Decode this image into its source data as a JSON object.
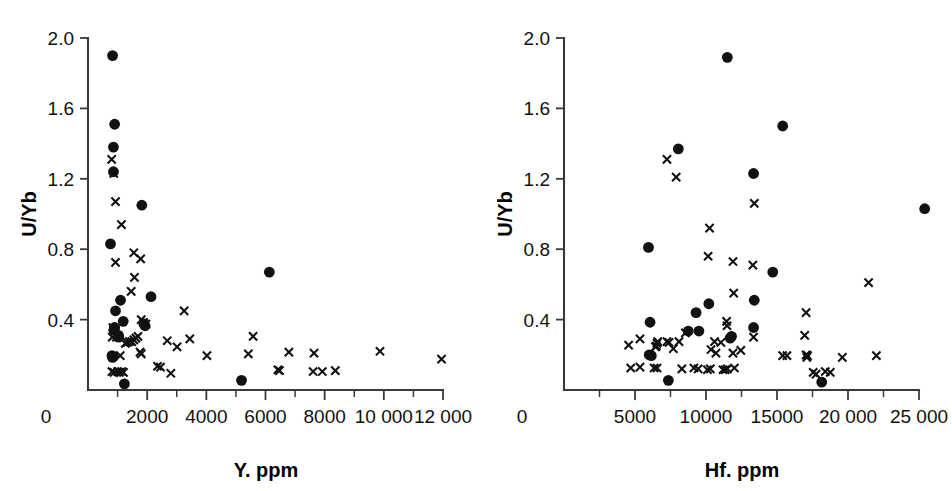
{
  "figure": {
    "background": "#ffffff",
    "marker_color": "#111111",
    "axis_color": "#3a3a3a",
    "panel_count": 2
  },
  "series_names": {
    "circle": "filled-circle-series",
    "cross": "cross-series"
  },
  "chart_data": [
    {
      "type": "scatter",
      "panel": "left",
      "title": "",
      "xlabel": "Y. ppm",
      "ylabel": "U/Yb",
      "xlim": [
        0,
        12000
      ],
      "ylim": [
        0,
        2.0
      ],
      "xticks": [
        0,
        2000,
        4000,
        6000,
        8000,
        10000,
        12000
      ],
      "xtick_labels": [
        "0",
        "2000",
        "4000",
        "6000",
        "8000",
        "10 000",
        "12 000"
      ],
      "yticks": [
        0.4,
        0.8,
        1.2,
        1.6,
        2.0
      ],
      "ytick_labels": [
        "0.4",
        "0.8",
        "1.2",
        "1.6",
        "2.0"
      ],
      "xminor_step": 1000,
      "grid": false,
      "legend": "none",
      "series": [
        {
          "name": "filled-circle-series",
          "marker": "circle",
          "points": [
            [
              830,
              1.9
            ],
            [
              900,
              1.51
            ],
            [
              860,
              1.38
            ],
            [
              860,
              1.24
            ],
            [
              1820,
              1.05
            ],
            [
              760,
              0.83
            ],
            [
              6130,
              0.67
            ],
            [
              1100,
              0.51
            ],
            [
              2130,
              0.53
            ],
            [
              930,
              0.45
            ],
            [
              1190,
              0.39
            ],
            [
              900,
              0.355
            ],
            [
              880,
              0.345
            ],
            [
              1030,
              0.31
            ],
            [
              1890,
              0.375
            ],
            [
              1930,
              0.365
            ],
            [
              1040,
              0.3
            ],
            [
              810,
              0.195
            ],
            [
              830,
              0.185
            ],
            [
              850,
              0.19
            ],
            [
              1230,
              0.035
            ],
            [
              5190,
              0.055
            ]
          ]
        },
        {
          "name": "cross-series",
          "marker": "cross",
          "points": [
            [
              800,
              1.31
            ],
            [
              870,
              1.23
            ],
            [
              930,
              1.07
            ],
            [
              1130,
              0.94
            ],
            [
              1550,
              0.78
            ],
            [
              1780,
              0.745
            ],
            [
              930,
              0.725
            ],
            [
              1570,
              0.64
            ],
            [
              1460,
              0.56
            ],
            [
              3250,
              0.45
            ],
            [
              1800,
              0.4
            ],
            [
              1880,
              0.385
            ],
            [
              1960,
              0.375
            ],
            [
              840,
              0.355
            ],
            [
              870,
              0.345
            ],
            [
              900,
              0.335
            ],
            [
              820,
              0.3
            ],
            [
              960,
              0.3
            ],
            [
              1690,
              0.305
            ],
            [
              1620,
              0.295
            ],
            [
              1550,
              0.285
            ],
            [
              1480,
              0.275
            ],
            [
              1400,
              0.275
            ],
            [
              1330,
              0.27
            ],
            [
              1260,
              0.265
            ],
            [
              2680,
              0.28
            ],
            [
              3440,
              0.29
            ],
            [
              5580,
              0.305
            ],
            [
              6790,
              0.215
            ],
            [
              7640,
              0.21
            ],
            [
              9870,
              0.22
            ],
            [
              3010,
              0.245
            ],
            [
              4020,
              0.195
            ],
            [
              5420,
              0.205
            ],
            [
              11950,
              0.175
            ],
            [
              1760,
              0.215
            ],
            [
              1800,
              0.205
            ],
            [
              1090,
              0.195
            ],
            [
              2350,
              0.135
            ],
            [
              2450,
              0.13
            ],
            [
              2800,
              0.095
            ],
            [
              6420,
              0.115
            ],
            [
              6470,
              0.11
            ],
            [
              7610,
              0.105
            ],
            [
              7920,
              0.105
            ],
            [
              8360,
              0.11
            ],
            [
              810,
              0.105
            ],
            [
              880,
              0.1
            ],
            [
              1000,
              0.105
            ],
            [
              1060,
              0.1
            ],
            [
              1140,
              0.105
            ],
            [
              1200,
              0.1
            ]
          ]
        }
      ]
    },
    {
      "type": "scatter",
      "panel": "right",
      "title": "",
      "xlabel": "Hf. ppm",
      "ylabel": "U/Yb",
      "xlim": [
        0,
        25000
      ],
      "ylim": [
        0,
        2.0
      ],
      "xticks": [
        0,
        5000,
        10000,
        15000,
        20000,
        25000
      ],
      "xtick_labels": [
        "0",
        "5000",
        "10000",
        "15000",
        "20 000",
        "25 000"
      ],
      "yticks": [
        0.4,
        0.8,
        1.2,
        1.6,
        2.0
      ],
      "ytick_labels": [
        "0.4",
        "0.8",
        "1.2",
        "1.6",
        "2.0"
      ],
      "xminor_step": 2500,
      "grid": false,
      "legend": "none",
      "series": [
        {
          "name": "filled-circle-series",
          "marker": "circle",
          "points": [
            [
              11500,
              1.89
            ],
            [
              15400,
              1.5
            ],
            [
              8050,
              1.37
            ],
            [
              13350,
              1.23
            ],
            [
              25400,
              1.03
            ],
            [
              5950,
              0.81
            ],
            [
              14700,
              0.67
            ],
            [
              13400,
              0.51
            ],
            [
              10200,
              0.49
            ],
            [
              9300,
              0.44
            ],
            [
              13350,
              0.355
            ],
            [
              6060,
              0.385
            ],
            [
              9500,
              0.335
            ],
            [
              8750,
              0.335
            ],
            [
              11800,
              0.305
            ],
            [
              11700,
              0.295
            ],
            [
              6000,
              0.2
            ],
            [
              6150,
              0.195
            ],
            [
              7350,
              0.055
            ],
            [
              18150,
              0.045
            ]
          ]
        },
        {
          "name": "cross-series",
          "marker": "cross",
          "points": [
            [
              7250,
              1.31
            ],
            [
              7900,
              1.21
            ],
            [
              13400,
              1.06
            ],
            [
              10250,
              0.92
            ],
            [
              10150,
              0.76
            ],
            [
              11900,
              0.73
            ],
            [
              13300,
              0.71
            ],
            [
              21450,
              0.61
            ],
            [
              11950,
              0.55
            ],
            [
              17050,
              0.44
            ],
            [
              11450,
              0.39
            ],
            [
              11480,
              0.365
            ],
            [
              8550,
              0.325
            ],
            [
              13350,
              0.3
            ],
            [
              16950,
              0.31
            ],
            [
              5350,
              0.29
            ],
            [
              6600,
              0.275
            ],
            [
              6550,
              0.265
            ],
            [
              7250,
              0.275
            ],
            [
              7400,
              0.27
            ],
            [
              8100,
              0.275
            ],
            [
              10600,
              0.275
            ],
            [
              11050,
              0.27
            ],
            [
              4550,
              0.255
            ],
            [
              6500,
              0.25
            ],
            [
              6450,
              0.245
            ],
            [
              7700,
              0.235
            ],
            [
              10350,
              0.23
            ],
            [
              12450,
              0.225
            ],
            [
              10700,
              0.21
            ],
            [
              11900,
              0.21
            ],
            [
              15400,
              0.195
            ],
            [
              15700,
              0.195
            ],
            [
              17050,
              0.2
            ],
            [
              17150,
              0.195
            ],
            [
              17100,
              0.185
            ],
            [
              19600,
              0.185
            ],
            [
              22000,
              0.195
            ],
            [
              4700,
              0.125
            ],
            [
              5350,
              0.13
            ],
            [
              6350,
              0.125
            ],
            [
              6550,
              0.125
            ],
            [
              8300,
              0.12
            ],
            [
              9150,
              0.125
            ],
            [
              9450,
              0.12
            ],
            [
              10100,
              0.115
            ],
            [
              10300,
              0.12
            ],
            [
              11200,
              0.115
            ],
            [
              11350,
              0.115
            ],
            [
              11500,
              0.12
            ],
            [
              12000,
              0.125
            ],
            [
              17550,
              0.1
            ],
            [
              17750,
              0.09
            ],
            [
              18400,
              0.105
            ],
            [
              18750,
              0.1
            ]
          ]
        }
      ]
    }
  ]
}
